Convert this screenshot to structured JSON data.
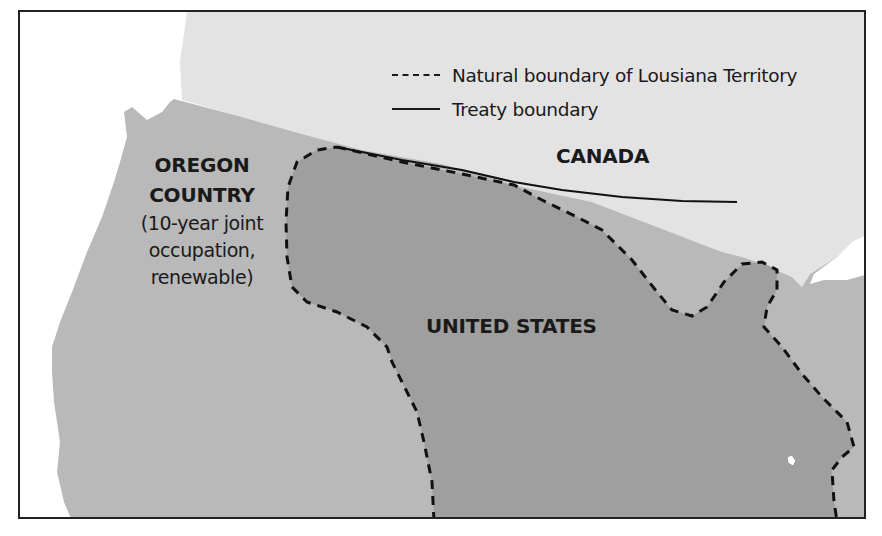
{
  "legend": {
    "items": [
      {
        "style": "dashed",
        "label": "Natural boundary of Lousiana Territory"
      },
      {
        "style": "solid",
        "label": "Treaty boundary"
      }
    ]
  },
  "regions": {
    "oregon": {
      "line1": "OREGON",
      "line2": "COUNTRY",
      "note1": "(10-year joint",
      "note2": "occupation,",
      "note3": "renewable)"
    },
    "canada": {
      "label": "CANADA"
    },
    "united_states": {
      "label": "UNITED STATES"
    }
  },
  "colors": {
    "ocean": "#ffffff",
    "canada": "#e2e2e2",
    "oregon_country": "#b9b9b9",
    "louisiana": "#9f9f9f",
    "border": "#222222"
  }
}
